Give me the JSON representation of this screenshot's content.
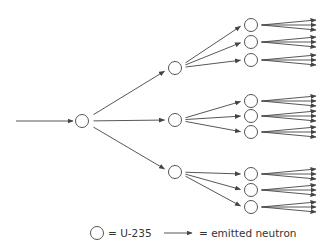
{
  "diagram": {
    "type": "nuclear-chain-reaction",
    "colors": {
      "stroke": "#555555",
      "background": "#ffffff",
      "text": "#333333"
    },
    "incoming_neutron": {
      "x1": 16,
      "y1": 121,
      "x2": 73,
      "y2": 121
    },
    "generation_1": [
      {
        "id": "n1",
        "cx": 82,
        "cy": 121
      }
    ],
    "generation_2": [
      {
        "id": "n2a",
        "cx": 175,
        "cy": 68
      },
      {
        "id": "n2b",
        "cx": 175,
        "cy": 120
      },
      {
        "id": "n2c",
        "cx": 175,
        "cy": 172
      }
    ],
    "generation_3": [
      {
        "id": "n3a1",
        "cx": 251,
        "cy": 25,
        "parent": "n2a"
      },
      {
        "id": "n3a2",
        "cx": 251,
        "cy": 42,
        "parent": "n2a"
      },
      {
        "id": "n3a3",
        "cx": 251,
        "cy": 60,
        "parent": "n2a"
      },
      {
        "id": "n3b1",
        "cx": 251,
        "cy": 101,
        "parent": "n2b"
      },
      {
        "id": "n3b2",
        "cx": 251,
        "cy": 116,
        "parent": "n2b"
      },
      {
        "id": "n3b3",
        "cx": 251,
        "cy": 132,
        "parent": "n2b"
      },
      {
        "id": "n3c1",
        "cx": 251,
        "cy": 174,
        "parent": "n2c"
      },
      {
        "id": "n3c2",
        "cx": 251,
        "cy": 190,
        "parent": "n2c"
      },
      {
        "id": "n3c3",
        "cx": 251,
        "cy": 207,
        "parent": "n2c"
      }
    ],
    "circle_radius": 6.5,
    "fanout_per_fission": 3,
    "final_arrow_end_x": 316
  },
  "legend": {
    "uranium_label": "= U-235",
    "neutron_label": "= emitted neutron"
  }
}
